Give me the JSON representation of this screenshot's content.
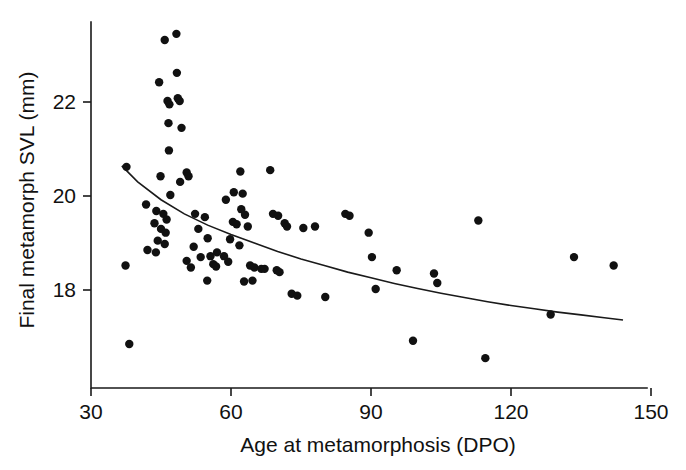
{
  "chart_data": {
    "type": "scatter",
    "title": "",
    "xlabel": "Age at metamorphosis (DPO)",
    "ylabel": "Final metamorph SVL (mm)",
    "xlim": [
      30,
      150
    ],
    "ylim": [
      16.3,
      23.7
    ],
    "xticks": [
      30,
      60,
      90,
      120,
      150
    ],
    "yticks": [
      18,
      20,
      22
    ],
    "xtick_labels": [
      "30",
      "60",
      "90",
      "120",
      "150"
    ],
    "ytick_labels": [
      "18",
      "20",
      "22"
    ],
    "grid": false,
    "legend": null,
    "point_color": "#111111",
    "curve_color": "#1a1a1a",
    "axis_color": "#1a1a1a",
    "marker_radius_px": 4.2,
    "points": [
      [
        45.8,
        23.32
      ],
      [
        48.3,
        23.45
      ],
      [
        48.4,
        22.62
      ],
      [
        44.6,
        22.42
      ],
      [
        46.4,
        22.02
      ],
      [
        46.8,
        21.95
      ],
      [
        48.6,
        22.08
      ],
      [
        49.0,
        22.02
      ],
      [
        46.6,
        21.55
      ],
      [
        49.4,
        21.45
      ],
      [
        46.7,
        20.97
      ],
      [
        37.6,
        20.62
      ],
      [
        44.9,
        20.42
      ],
      [
        49.1,
        20.3
      ],
      [
        50.5,
        20.5
      ],
      [
        50.9,
        20.42
      ],
      [
        47.0,
        20.02
      ],
      [
        41.8,
        19.82
      ],
      [
        44.0,
        19.68
      ],
      [
        45.5,
        19.62
      ],
      [
        46.2,
        19.5
      ],
      [
        43.6,
        19.42
      ],
      [
        45.0,
        19.3
      ],
      [
        46.0,
        19.22
      ],
      [
        44.3,
        19.05
      ],
      [
        45.8,
        18.98
      ],
      [
        42.1,
        18.85
      ],
      [
        43.9,
        18.8
      ],
      [
        37.4,
        18.52
      ],
      [
        38.2,
        16.85
      ],
      [
        52.3,
        19.62
      ],
      [
        53.0,
        19.3
      ],
      [
        54.4,
        19.55
      ],
      [
        55.0,
        19.1
      ],
      [
        52.0,
        18.92
      ],
      [
        53.5,
        18.7
      ],
      [
        50.5,
        18.62
      ],
      [
        51.4,
        18.48
      ],
      [
        55.6,
        18.72
      ],
      [
        57.0,
        18.8
      ],
      [
        56.2,
        18.55
      ],
      [
        56.8,
        18.5
      ],
      [
        54.9,
        18.2
      ],
      [
        58.9,
        19.92
      ],
      [
        60.6,
        20.08
      ],
      [
        62.0,
        20.52
      ],
      [
        62.5,
        20.05
      ],
      [
        62.2,
        19.72
      ],
      [
        63.0,
        19.6
      ],
      [
        60.4,
        19.45
      ],
      [
        61.2,
        19.4
      ],
      [
        63.6,
        19.35
      ],
      [
        59.8,
        19.08
      ],
      [
        61.8,
        18.95
      ],
      [
        58.5,
        18.72
      ],
      [
        59.4,
        18.6
      ],
      [
        64.1,
        18.52
      ],
      [
        65.0,
        18.48
      ],
      [
        66.5,
        18.45
      ],
      [
        67.2,
        18.45
      ],
      [
        62.8,
        18.18
      ],
      [
        64.6,
        18.2
      ],
      [
        68.4,
        20.55
      ],
      [
        69.0,
        19.62
      ],
      [
        70.1,
        19.58
      ],
      [
        71.5,
        19.42
      ],
      [
        72.0,
        19.35
      ],
      [
        69.8,
        18.42
      ],
      [
        70.4,
        18.38
      ],
      [
        73.0,
        17.92
      ],
      [
        74.2,
        17.88
      ],
      [
        75.5,
        19.32
      ],
      [
        78.0,
        19.35
      ],
      [
        80.2,
        17.85
      ],
      [
        84.5,
        19.62
      ],
      [
        85.4,
        19.58
      ],
      [
        89.5,
        19.22
      ],
      [
        90.2,
        18.7
      ],
      [
        91.0,
        18.02
      ],
      [
        95.5,
        18.42
      ],
      [
        99.0,
        16.92
      ],
      [
        103.5,
        18.35
      ],
      [
        104.2,
        18.15
      ],
      [
        113.0,
        19.48
      ],
      [
        114.5,
        16.55
      ],
      [
        128.5,
        17.48
      ],
      [
        133.5,
        18.7
      ],
      [
        142.0,
        18.52
      ]
    ],
    "fit_curve": {
      "description": "Fitted decreasing curve (negative exponential / power decay)",
      "points": [
        [
          36.6,
          20.64
        ],
        [
          40.0,
          20.3
        ],
        [
          45.0,
          19.92
        ],
        [
          50.0,
          19.62
        ],
        [
          55.0,
          19.38
        ],
        [
          60.0,
          19.18
        ],
        [
          65.0,
          19.0
        ],
        [
          70.0,
          18.82
        ],
        [
          75.0,
          18.66
        ],
        [
          80.0,
          18.52
        ],
        [
          85.0,
          18.38
        ],
        [
          90.0,
          18.26
        ],
        [
          95.0,
          18.14
        ],
        [
          100.0,
          18.03
        ],
        [
          105.0,
          17.93
        ],
        [
          110.0,
          17.84
        ],
        [
          115.0,
          17.75
        ],
        [
          120.0,
          17.67
        ],
        [
          125.0,
          17.6
        ],
        [
          130.0,
          17.53
        ],
        [
          135.0,
          17.47
        ],
        [
          140.0,
          17.41
        ],
        [
          144.0,
          17.36
        ]
      ]
    }
  }
}
